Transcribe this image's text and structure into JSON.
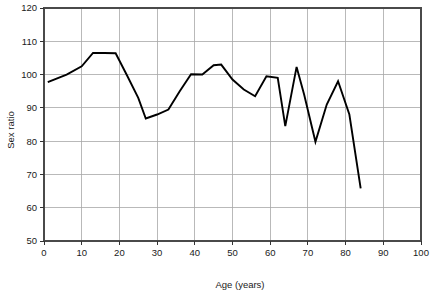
{
  "chart_data": {
    "type": "line",
    "title": "",
    "xlabel": "Age (years)",
    "ylabel": "Sex ratio",
    "xlim": [
      0,
      100
    ],
    "ylim": [
      50,
      120
    ],
    "grid": true,
    "legend": null,
    "xticks": [
      0,
      10,
      20,
      30,
      40,
      50,
      60,
      70,
      80,
      90,
      100
    ],
    "xtick_labels": [
      "0",
      "10",
      "20",
      "30",
      "40",
      "50",
      "60",
      "70",
      "80",
      "90",
      "100"
    ],
    "yticks": [
      50,
      60,
      70,
      80,
      90,
      100,
      110,
      120
    ],
    "ytick_labels": [
      "50",
      "60",
      "70",
      "80",
      "90",
      "100",
      "110",
      "120"
    ],
    "series": [
      {
        "name": "Sex ratio",
        "color": "#000000",
        "x": [
          1,
          6,
          10,
          13,
          16,
          19,
          22,
          25,
          27,
          30,
          33,
          36,
          39,
          42,
          45,
          47,
          50,
          53,
          56,
          59,
          62,
          64,
          67,
          69,
          72,
          75,
          78,
          81,
          84
        ],
        "y": [
          97.7,
          100.0,
          102.5,
          106.5,
          106.5,
          106.4,
          99.8,
          93.0,
          86.8,
          88.0,
          89.5,
          95.0,
          100.1,
          100.0,
          102.8,
          103.0,
          98.5,
          95.5,
          93.5,
          99.5,
          99.0,
          84.5,
          102.3,
          94.0,
          79.8,
          91.0,
          98.0,
          88.0,
          65.8
        ]
      }
    ]
  },
  "axes": {
    "y_label": "Sex ratio",
    "x_label": "Age (years)"
  }
}
